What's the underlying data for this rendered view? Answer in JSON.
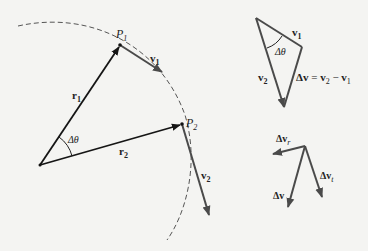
{
  "figure": {
    "colors": {
      "background": "#f4f4f2",
      "position_vector": "#151515",
      "velocity_vector": "#4a4a4a",
      "arc": "#555555"
    },
    "left_panel": {
      "origin": [
        40,
        165
      ],
      "path_arc": {
        "style": "dashed",
        "start": [
          18,
          26
        ],
        "end": [
          167,
          240
        ]
      },
      "points": [
        {
          "id": "P1",
          "label": "P",
          "subscript": "1",
          "pos": [
            120,
            45
          ]
        },
        {
          "id": "P2",
          "label": "P",
          "subscript": "2",
          "pos": [
            182,
            124
          ]
        }
      ],
      "vectors": [
        {
          "id": "r1",
          "label": "r",
          "subscript": "1",
          "from": [
            40,
            165
          ],
          "to": [
            120,
            45
          ]
        },
        {
          "id": "r2",
          "label": "r",
          "subscript": "2",
          "from": [
            40,
            165
          ],
          "to": [
            182,
            124
          ]
        },
        {
          "id": "v1",
          "label": "v",
          "subscript": "1",
          "from": [
            120,
            45
          ],
          "to": [
            162,
            72
          ]
        },
        {
          "id": "v2",
          "label": "v",
          "subscript": "2",
          "from": [
            182,
            124
          ],
          "to": [
            209,
            215
          ]
        }
      ],
      "angle_label": "Δθ"
    },
    "triangle_panel": {
      "vertices": {
        "top": [
          256,
          18
        ],
        "right": [
          302,
          47
        ],
        "bottom": [
          284,
          107
        ]
      },
      "labels": {
        "v1": {
          "text": "v",
          "subscript": "1"
        },
        "v2": {
          "text": "v",
          "subscript": "2"
        },
        "angle": "Δθ",
        "delta_v_eq": {
          "lhs": "Δv",
          "eq": " = ",
          "a": "v",
          "a_sub": "2",
          "minus": " − ",
          "b": "v",
          "b_sub": "1"
        }
      }
    },
    "components_panel": {
      "origin": [
        305,
        146
      ],
      "vectors": [
        {
          "id": "dvr",
          "label": "Δv",
          "subscript": "r",
          "to": [
            273,
            154
          ]
        },
        {
          "id": "dvt",
          "label": "Δv",
          "subscript": "t",
          "to": [
            322,
            197
          ]
        },
        {
          "id": "dv",
          "label": "Δv",
          "subscript": "",
          "to": [
            288,
            207
          ]
        }
      ]
    }
  }
}
